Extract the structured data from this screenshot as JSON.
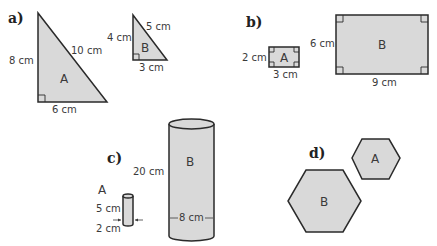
{
  "parts": {
    "a": {
      "label": "a)",
      "shape_a": {
        "name": "A",
        "height": "8 cm",
        "hypotenuse": "10 cm",
        "base": "6 cm"
      },
      "shape_b": {
        "name": "B",
        "height": "4 cm",
        "hypotenuse": "5 cm",
        "base": "3 cm"
      }
    },
    "b": {
      "label": "b)",
      "shape_a": {
        "name": "A",
        "height": "2 cm",
        "width": "3 cm"
      },
      "shape_b": {
        "name": "B",
        "height": "6 cm",
        "width": "9 cm"
      }
    },
    "c": {
      "label": "c)",
      "shape_a": {
        "name": "A",
        "height": "5 cm",
        "diameter": "2 cm"
      },
      "shape_b": {
        "name": "B",
        "height": "20 cm",
        "diameter": "8 cm"
      }
    },
    "d": {
      "label": "d)",
      "shape_a": {
        "name": "A"
      },
      "shape_b": {
        "name": "B"
      }
    }
  },
  "colors": {
    "fill": "#d9d9d9",
    "stroke": "#2a2a2a",
    "text": "#3a3a3a"
  }
}
